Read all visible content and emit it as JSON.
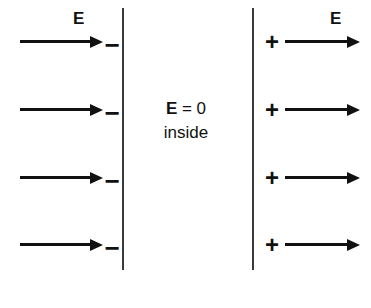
{
  "diagram": {
    "colors": {
      "ink": "#111111",
      "surface": "#3a3a3a",
      "background": "#ffffff"
    },
    "surfaces": [
      {
        "name": "left-surface",
        "x": 122,
        "top": 8,
        "height": 262
      },
      {
        "name": "right-surface",
        "x": 252,
        "top": 8,
        "height": 262
      }
    ],
    "interior": {
      "field_symbol": "E",
      "equals_zero": " = 0",
      "equation": "E = 0",
      "inside_label": "inside"
    },
    "left_region": {
      "field_label": "E",
      "charge_sign": "−",
      "arrow_count": 4,
      "arrow_direction": "right",
      "rows": [
        {
          "label": "row-1",
          "y": 36,
          "charge_y": 32
        },
        {
          "label": "row-2",
          "y": 104,
          "charge_y": 100
        },
        {
          "label": "row-3",
          "y": 172,
          "charge_y": 168
        },
        {
          "label": "row-4",
          "y": 239,
          "charge_y": 235
        }
      ]
    },
    "right_region": {
      "field_label": "E",
      "charge_sign": "+",
      "arrow_count": 4,
      "arrow_direction": "right",
      "rows": [
        {
          "label": "row-1",
          "y": 36,
          "charge_y": 30
        },
        {
          "label": "row-2",
          "y": 104,
          "charge_y": 98
        },
        {
          "label": "row-3",
          "y": 172,
          "charge_y": 166
        },
        {
          "label": "row-4",
          "y": 239,
          "charge_y": 233
        }
      ]
    }
  }
}
